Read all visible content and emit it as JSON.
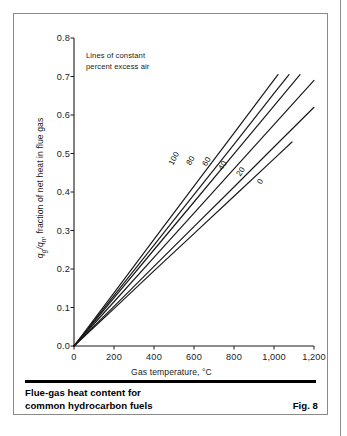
{
  "figure": {
    "caption": "Flue-gas heat content for\ncommon hydrocarbon fuels",
    "figure_number": "Fig. 8"
  },
  "chart_data": {
    "type": "line",
    "title": "",
    "annotation": "Lines of constant\npercent excess air",
    "xlabel": "Gas temperature, °C",
    "ylabel_plain": "qg/qn, fraction of net heat in flue gas",
    "ylabel_parts": {
      "num": "q",
      "num_sub": "g",
      "den": "q",
      "den_sub": "n",
      "rest": ", fraction of net heat in flue gas"
    },
    "xlim": [
      0,
      1200
    ],
    "ylim": [
      0.0,
      0.8
    ],
    "xticks": [
      0,
      200,
      400,
      600,
      800,
      1000,
      1200
    ],
    "xtick_labels": [
      "0",
      "200",
      "400",
      "600",
      "800",
      "1,000",
      "1,200"
    ],
    "yticks": [
      0.0,
      0.1,
      0.2,
      0.3,
      0.4,
      0.5,
      0.6,
      0.7,
      0.8
    ],
    "ytick_labels": [
      "0.0",
      "0.1",
      "0.2",
      "0.3",
      "0.4",
      "0.5",
      "0.6",
      "0.7",
      "0.8"
    ],
    "grid": false,
    "legend_position": "inline-curve-labels",
    "legend_title": "percent excess air",
    "line_color": "#1a1a1a",
    "series": [
      {
        "name": "0",
        "label": "0",
        "excess_air_percent": 0,
        "x": [
          0,
          200,
          400,
          600,
          800,
          1000,
          1090
        ],
        "y": [
          0.0,
          0.097,
          0.195,
          0.292,
          0.389,
          0.486,
          0.53
        ],
        "label_at": {
          "x": 930,
          "y": 0.428,
          "angle": -56
        }
      },
      {
        "name": "20",
        "label": "20",
        "excess_air_percent": 20,
        "x": [
          0,
          200,
          400,
          600,
          800,
          1000,
          1200
        ],
        "y": [
          0.0,
          0.103,
          0.207,
          0.31,
          0.413,
          0.517,
          0.62
        ],
        "label_at": {
          "x": 830,
          "y": 0.452,
          "angle": -56
        }
      },
      {
        "name": "40",
        "label": "40",
        "excess_air_percent": 40,
        "x": [
          0,
          200,
          400,
          600,
          800,
          1000,
          1200
        ],
        "y": [
          0.0,
          0.115,
          0.23,
          0.345,
          0.46,
          0.575,
          0.69
        ],
        "label_at": {
          "x": 740,
          "y": 0.468,
          "angle": -58
        }
      },
      {
        "name": "60",
        "label": "60",
        "excess_air_percent": 60,
        "x": [
          0,
          200,
          400,
          600,
          800,
          1000,
          1130
        ],
        "y": [
          0.0,
          0.125,
          0.25,
          0.374,
          0.499,
          0.624,
          0.705
        ],
        "label_at": {
          "x": 660,
          "y": 0.478,
          "angle": -58
        }
      },
      {
        "name": "80",
        "label": "80",
        "excess_air_percent": 80,
        "x": [
          0,
          200,
          400,
          600,
          800,
          1000,
          1075
        ],
        "y": [
          0.0,
          0.131,
          0.262,
          0.393,
          0.524,
          0.656,
          0.705
        ],
        "label_at": {
          "x": 580,
          "y": 0.482,
          "angle": -60
        }
      },
      {
        "name": "100",
        "label": "100",
        "excess_air_percent": 100,
        "x": [
          0,
          200,
          400,
          600,
          800,
          1000,
          1020
        ],
        "y": [
          0.0,
          0.138,
          0.277,
          0.415,
          0.553,
          0.691,
          0.705
        ],
        "label_at": {
          "x": 500,
          "y": 0.487,
          "angle": -62
        }
      }
    ]
  }
}
